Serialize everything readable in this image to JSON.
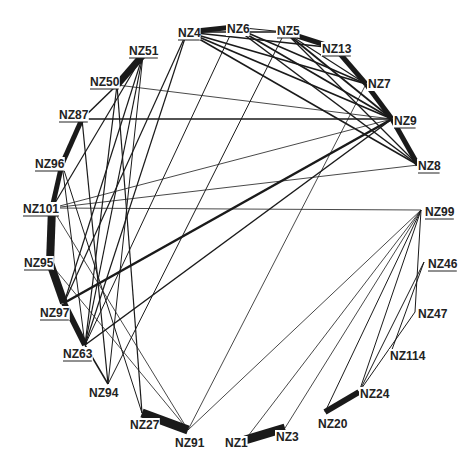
{
  "nodes": [
    {
      "id": "NZ4",
      "x": 187,
      "y": 32,
      "lx": 178,
      "ly": 37,
      "underline": true
    },
    {
      "id": "NZ6",
      "x": 234,
      "y": 27,
      "lx": 227,
      "ly": 33,
      "underline": false
    },
    {
      "id": "NZ5",
      "x": 285,
      "y": 32,
      "lx": 277,
      "ly": 35,
      "underline": true
    },
    {
      "id": "NZ13",
      "x": 335,
      "y": 48,
      "lx": 322,
      "ly": 53,
      "underline": true
    },
    {
      "id": "NZ7",
      "x": 366,
      "y": 84,
      "lx": 368,
      "ly": 88,
      "underline": false
    },
    {
      "id": "NZ9",
      "x": 392,
      "y": 119,
      "lx": 394,
      "ly": 125,
      "underline": true
    },
    {
      "id": "NZ8",
      "x": 418,
      "y": 165,
      "lx": 418,
      "ly": 170,
      "underline": true
    },
    {
      "id": "NZ99",
      "x": 421,
      "y": 210,
      "lx": 425,
      "ly": 216,
      "underline": true
    },
    {
      "id": "NZ46",
      "x": 424,
      "y": 262,
      "lx": 428,
      "ly": 268,
      "underline": true
    },
    {
      "id": "NZ47",
      "x": 415,
      "y": 312,
      "lx": 418,
      "ly": 318,
      "underline": false
    },
    {
      "id": "NZ114",
      "x": 390,
      "y": 355,
      "lx": 390,
      "ly": 360,
      "underline": false
    },
    {
      "id": "NZ24",
      "x": 359,
      "y": 392,
      "lx": 360,
      "ly": 398,
      "underline": false
    },
    {
      "id": "NZ20",
      "x": 325,
      "y": 412,
      "lx": 318,
      "ly": 428,
      "underline": false
    },
    {
      "id": "NZ3",
      "x": 285,
      "y": 428,
      "lx": 276,
      "ly": 441,
      "underline": false
    },
    {
      "id": "NZ1",
      "x": 245,
      "y": 440,
      "lx": 225,
      "ly": 447,
      "underline": false
    },
    {
      "id": "NZ91",
      "x": 188,
      "y": 430,
      "lx": 175,
      "ly": 447,
      "underline": false
    },
    {
      "id": "NZ27",
      "x": 142,
      "y": 413,
      "lx": 130,
      "ly": 429,
      "underline": false
    },
    {
      "id": "NZ94",
      "x": 108,
      "y": 384,
      "lx": 89,
      "ly": 397,
      "underline": false
    },
    {
      "id": "NZ63",
      "x": 85,
      "y": 345,
      "lx": 63,
      "ly": 358,
      "underline": true
    },
    {
      "id": "NZ97",
      "x": 64,
      "y": 303,
      "lx": 40,
      "ly": 317,
      "underline": true
    },
    {
      "id": "NZ95",
      "x": 50,
      "y": 263,
      "lx": 24,
      "ly": 267,
      "underline": true
    },
    {
      "id": "NZ101",
      "x": 52,
      "y": 208,
      "lx": 23,
      "ly": 213,
      "underline": true
    },
    {
      "id": "NZ96",
      "x": 62,
      "y": 164,
      "lx": 35,
      "ly": 168,
      "underline": true
    },
    {
      "id": "NZ87",
      "x": 82,
      "y": 119,
      "lx": 59,
      "ly": 119,
      "underline": true
    },
    {
      "id": "NZ50",
      "x": 117,
      "y": 85,
      "lx": 90,
      "ly": 86,
      "underline": true
    },
    {
      "id": "NZ51",
      "x": 143,
      "y": 55,
      "lx": 129,
      "ly": 55,
      "underline": true
    }
  ],
  "edges": [
    {
      "s": "NZ4",
      "t": "NZ6",
      "w": 5
    },
    {
      "s": "NZ6",
      "t": "NZ5",
      "w": 1
    },
    {
      "s": "NZ5",
      "t": "NZ13",
      "w": 5
    },
    {
      "s": "NZ13",
      "t": "NZ7",
      "w": 5
    },
    {
      "s": "NZ7",
      "t": "NZ9",
      "w": 5
    },
    {
      "s": "NZ9",
      "t": "NZ8",
      "w": 5
    },
    {
      "s": "NZ51",
      "t": "NZ50",
      "w": 7
    },
    {
      "s": "NZ50",
      "t": "NZ87",
      "w": 1.5
    },
    {
      "s": "NZ87",
      "t": "NZ96",
      "w": 5
    },
    {
      "s": "NZ96",
      "t": "NZ101",
      "w": 5
    },
    {
      "s": "NZ101",
      "t": "NZ95",
      "w": 8
    },
    {
      "s": "NZ95",
      "t": "NZ97",
      "w": 8
    },
    {
      "s": "NZ97",
      "t": "NZ63",
      "w": 6
    },
    {
      "s": "NZ63",
      "t": "NZ94",
      "w": 1.5
    },
    {
      "s": "NZ27",
      "t": "NZ91",
      "w": 9
    },
    {
      "s": "NZ1",
      "t": "NZ3",
      "w": 9
    },
    {
      "s": "NZ20",
      "t": "NZ24",
      "w": 6
    },
    {
      "s": "NZ4",
      "t": "NZ9",
      "w": 1.8
    },
    {
      "s": "NZ4",
      "t": "NZ7",
      "w": 1.8
    },
    {
      "s": "NZ4",
      "t": "NZ13",
      "w": 1.5
    },
    {
      "s": "NZ4",
      "t": "NZ8",
      "w": 1.5
    },
    {
      "s": "NZ4",
      "t": "NZ63",
      "w": 1.2
    },
    {
      "s": "NZ4",
      "t": "NZ97",
      "w": 1.2
    },
    {
      "s": "NZ4",
      "t": "NZ5",
      "w": 1.5
    },
    {
      "s": "NZ6",
      "t": "NZ9",
      "w": 1.8
    },
    {
      "s": "NZ6",
      "t": "NZ7",
      "w": 1.5
    },
    {
      "s": "NZ6",
      "t": "NZ8",
      "w": 1.5
    },
    {
      "s": "NZ6",
      "t": "NZ63",
      "w": 1
    },
    {
      "s": "NZ5",
      "t": "NZ9",
      "w": 1.8
    },
    {
      "s": "NZ5",
      "t": "NZ8",
      "w": 1.2
    },
    {
      "s": "NZ5",
      "t": "NZ94",
      "w": 1
    },
    {
      "s": "NZ5",
      "t": "NZ7",
      "w": 1.2
    },
    {
      "s": "NZ7",
      "t": "NZ91",
      "w": 0.8
    },
    {
      "s": "NZ87",
      "t": "NZ9",
      "w": 1.5
    },
    {
      "s": "NZ87",
      "t": "NZ94",
      "w": 1.2
    },
    {
      "s": "NZ97",
      "t": "NZ9",
      "w": 2.5
    },
    {
      "s": "NZ63",
      "t": "NZ9",
      "w": 1.5
    },
    {
      "s": "NZ50",
      "t": "NZ9",
      "w": 0.8
    },
    {
      "s": "NZ50",
      "t": "NZ63",
      "w": 1.2
    },
    {
      "s": "NZ50",
      "t": "NZ27",
      "w": 1.2
    },
    {
      "s": "NZ51",
      "t": "NZ63",
      "w": 1.2
    },
    {
      "s": "NZ51",
      "t": "NZ97",
      "w": 1.2
    },
    {
      "s": "NZ51",
      "t": "NZ101",
      "w": 1.2
    },
    {
      "s": "NZ51",
      "t": "NZ94",
      "w": 1
    },
    {
      "s": "NZ101",
      "t": "NZ9",
      "w": 0.8
    },
    {
      "s": "NZ101",
      "t": "NZ99",
      "w": 0.8
    },
    {
      "s": "NZ101",
      "t": "NZ91",
      "w": 0.8
    },
    {
      "s": "NZ96",
      "t": "NZ27",
      "w": 1
    },
    {
      "s": "NZ96",
      "t": "NZ63",
      "w": 1
    },
    {
      "s": "NZ95",
      "t": "NZ91",
      "w": 0.8
    },
    {
      "s": "NZ8",
      "t": "NZ101",
      "w": 0.8
    },
    {
      "s": "NZ99",
      "t": "NZ91",
      "w": 0.8
    },
    {
      "s": "NZ99",
      "t": "NZ1",
      "w": 0.8
    },
    {
      "s": "NZ99",
      "t": "NZ3",
      "w": 0.8
    },
    {
      "s": "NZ99",
      "t": "NZ20",
      "w": 1
    },
    {
      "s": "NZ99",
      "t": "NZ47",
      "w": 1
    },
    {
      "s": "NZ99",
      "t": "NZ24",
      "w": 1
    },
    {
      "s": "NZ46",
      "t": "NZ114",
      "w": 1
    },
    {
      "s": "NZ46",
      "t": "NZ24",
      "w": 1
    },
    {
      "s": "NZ47",
      "t": "NZ24",
      "w": 1
    }
  ]
}
